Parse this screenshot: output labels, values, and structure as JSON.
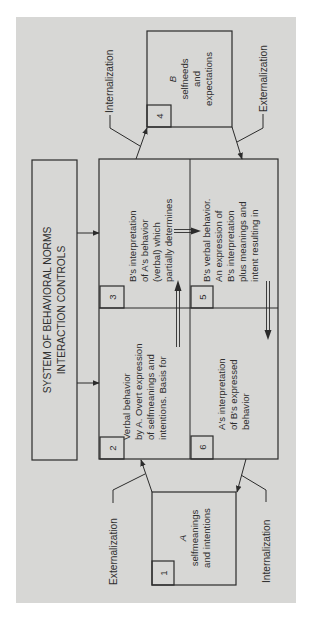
{
  "diagram": {
    "orientation": "rotated-90-ccw",
    "colors": {
      "background": "#ffffff",
      "panel": "#d7d7d5",
      "stroke": "#2b2b2b",
      "text": "#2f2f2f"
    },
    "system_box": {
      "line1": "SYSTEM OF BEHAVIORAL NORMS",
      "line2": "INTERACTION CONTROLS"
    },
    "boxes": [
      {
        "number": "1",
        "title": "A",
        "lines": [
          "selfmeanings",
          "and intentions"
        ]
      },
      {
        "number": "2",
        "lines": [
          "Verbal behavior",
          "by A. Overt expression",
          "of selfmeanings and",
          "intentions.  Basis for"
        ]
      },
      {
        "number": "3",
        "lines": [
          "B's interpretation",
          "of A's behavior",
          "(verbal) which",
          "partially determines"
        ]
      },
      {
        "number": "4",
        "title": "B",
        "lines": [
          "selfneeds",
          "and",
          "expectations"
        ]
      },
      {
        "number": "5",
        "lines": [
          "B's verbal behavior.",
          "An expression of",
          "B's interpretation",
          "plus meanings and",
          "intent  resulting in"
        ]
      },
      {
        "number": "6",
        "lines": [
          "A's interpretation",
          "of B's expressed",
          "behavior"
        ]
      }
    ],
    "labels": {
      "top_left": "Internalization",
      "top_right": "Externalization",
      "bottom_left": "Externalization",
      "bottom_right": "Internalization"
    }
  }
}
